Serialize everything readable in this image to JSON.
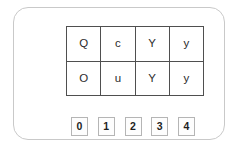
{
  "panel": {
    "border_color": "#c9c9c9",
    "background": "#ffffff"
  },
  "letter_grid": {
    "border_color": "#4f4f4f",
    "columns": 4,
    "rows_count": 2,
    "rows": [
      {
        "cells": [
          "Q",
          "c",
          "Y",
          "y"
        ]
      },
      {
        "cells": [
          "O",
          "u",
          "Y",
          "y"
        ]
      }
    ]
  },
  "index_buttons": {
    "border_color": "#b5b5b5",
    "items": [
      {
        "label": "0"
      },
      {
        "label": "1"
      },
      {
        "label": "2"
      },
      {
        "label": "3"
      },
      {
        "label": "4"
      }
    ]
  }
}
